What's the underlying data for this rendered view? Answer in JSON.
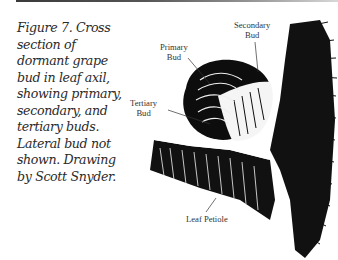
{
  "caption": {
    "lines": [
      "Figure 7. Cross",
      "section of",
      "dormant grape",
      "bud in leaf axil,",
      "showing primary,",
      "secondary, and",
      "tertiary buds.",
      "Lateral bud not",
      "shown. Drawing",
      "by Scott Snyder."
    ]
  },
  "figure": {
    "labels": {
      "secondary_bud": [
        "Secondary",
        "Bud"
      ],
      "primary_bud": [
        "Primary",
        "Bud"
      ],
      "tertiary_bud": [
        "Tertiary",
        "Bud"
      ],
      "leaf_petiole": "Leaf Petiole"
    }
  }
}
